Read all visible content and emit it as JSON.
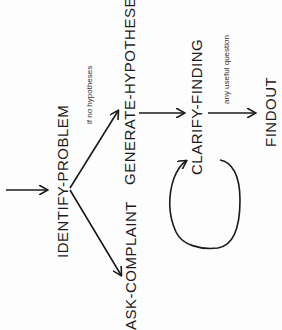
{
  "diagram": {
    "nodes": {
      "identify_problem": "IDENTIFY-PROBLEM",
      "ask_complaint": "ASK-COMPLAINT",
      "generate_hypotheses": "GENERATE-HYPOTHESES",
      "clarify_finding": "CLARIFY-FINDING",
      "findout": "FINDOUT"
    },
    "edge_labels": {
      "no_hypotheses": "if no hypotheses",
      "any_useful_question": "any useful question"
    },
    "colors": {
      "ink": "#1a1a1a",
      "background": "#fdfdfd"
    }
  }
}
